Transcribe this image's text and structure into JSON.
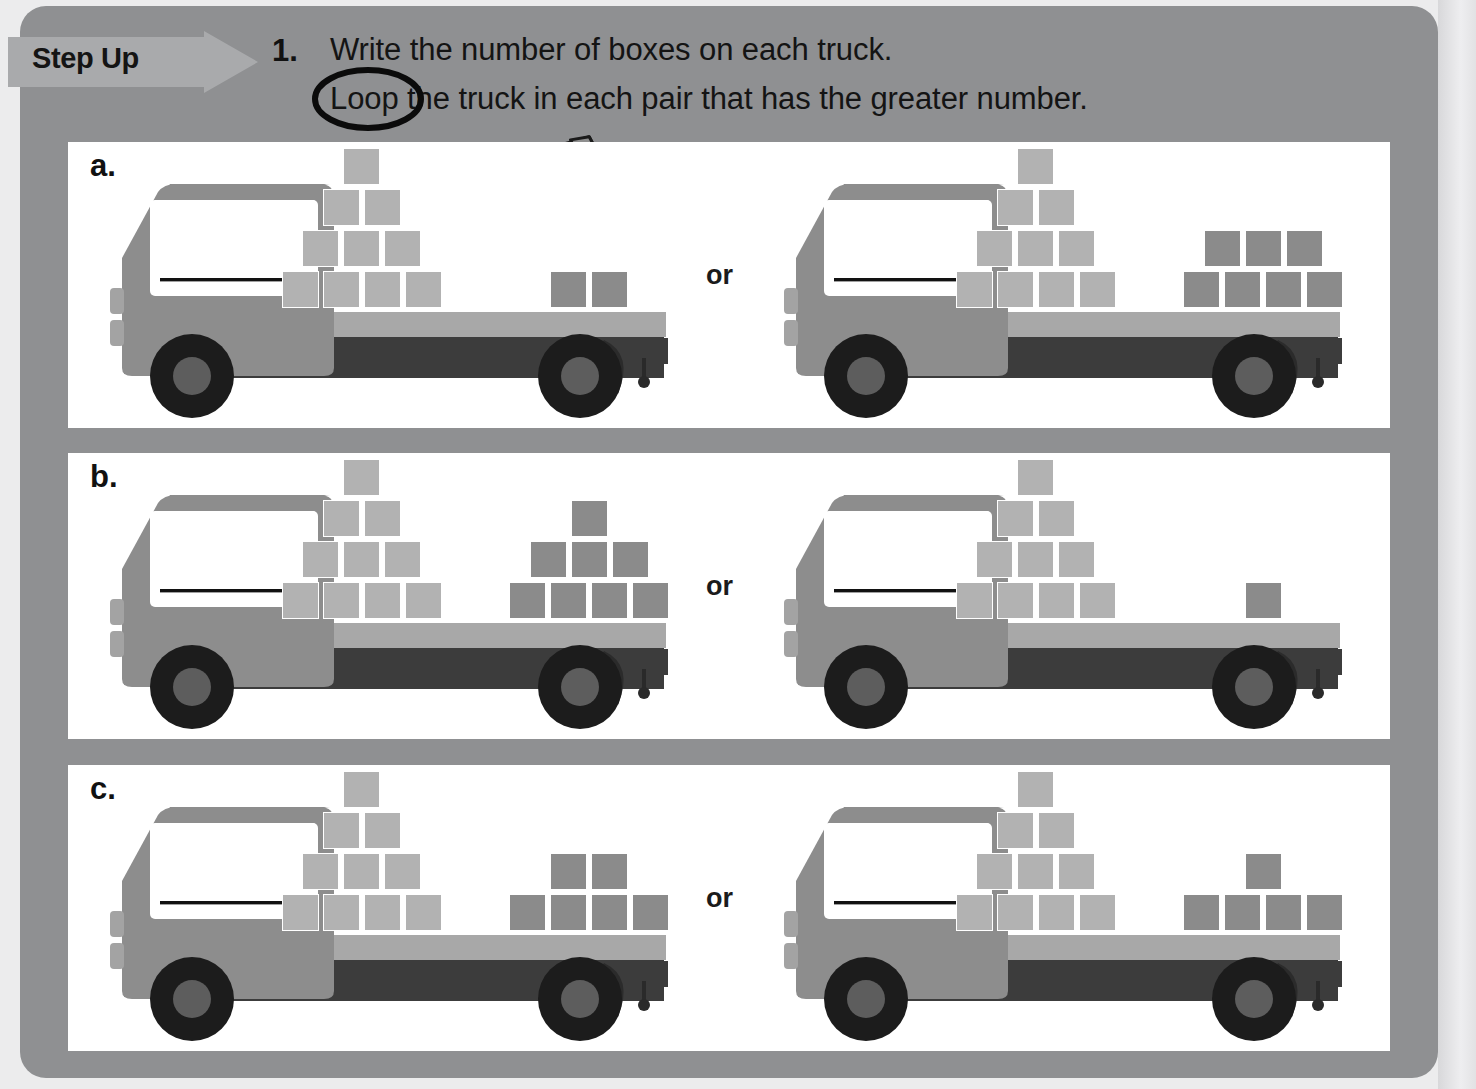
{
  "worksheet": {
    "banner_label": "Step Up",
    "question_number": "1.",
    "instruction_line1": "Write the number of boxes on each truck.",
    "instruction_line2_prefix": "Loop",
    "instruction_line2_rest": " the truck in each pair that has the greater number.",
    "instruction_line2_full": "Loop the truck in each pair that has the greater number.",
    "or_label": "or",
    "colors": {
      "panel": "#8f9092",
      "banner": "#a9aaac",
      "row_background": "#ffffff",
      "truck_cab": "#8d8d8d",
      "truck_bed": "#a8a8a8",
      "truck_chassis": "#3c3c3c",
      "wheel": "#1c1c1c",
      "box_light": "#b2b2b2",
      "box_dark": "#8b8b8b",
      "text": "#141414"
    },
    "rows": [
      {
        "letter": "a.",
        "left": {
          "answer_value": "",
          "pyramid_rows": [
            1,
            2,
            3,
            4
          ],
          "pyramid_count": 10,
          "group_rows": [
            0,
            2
          ],
          "group_count": 2,
          "total_boxes": 12
        },
        "right": {
          "answer_value": "",
          "pyramid_rows": [
            1,
            2,
            3,
            4
          ],
          "pyramid_count": 10,
          "group_rows": [
            0,
            3,
            4
          ],
          "group_count": 7,
          "total_boxes": 17
        }
      },
      {
        "letter": "b.",
        "left": {
          "answer_value": "",
          "pyramid_rows": [
            1,
            2,
            3,
            4
          ],
          "pyramid_count": 10,
          "group_rows": [
            1,
            3,
            4
          ],
          "group_count": 8,
          "total_boxes": 18
        },
        "right": {
          "answer_value": "",
          "pyramid_rows": [
            1,
            2,
            3,
            4
          ],
          "pyramid_count": 10,
          "group_rows": [
            0,
            1
          ],
          "group_count": 1,
          "total_boxes": 11
        }
      },
      {
        "letter": "c.",
        "left": {
          "answer_value": "",
          "pyramid_rows": [
            1,
            2,
            3,
            4
          ],
          "pyramid_count": 10,
          "group_rows": [
            0,
            2,
            4
          ],
          "group_count": 6,
          "total_boxes": 16
        },
        "right": {
          "answer_value": "",
          "pyramid_rows": [
            1,
            2,
            3,
            4
          ],
          "pyramid_count": 10,
          "group_rows": [
            0,
            1,
            4
          ],
          "group_count": 5,
          "total_boxes": 15
        }
      }
    ]
  }
}
